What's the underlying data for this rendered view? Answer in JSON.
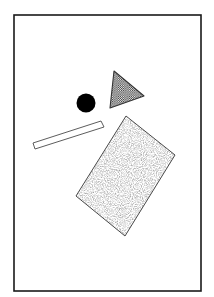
{
  "figure": {
    "canvas": {
      "width": 214,
      "height": 297,
      "background": "#ffffff"
    },
    "frame": {
      "name": "outer-frame",
      "x": 14,
      "y": 15,
      "width": 187,
      "height": 276,
      "stroke": "#1a1a1a",
      "stroke_width": 1.6,
      "fill": "none"
    },
    "shapes": [
      {
        "id": "circle",
        "label": "Solid black circle",
        "type": "circle",
        "cx": 86,
        "cy": 103,
        "r": 9.5,
        "fill": "#000000",
        "stroke": "none",
        "pattern": "solid"
      },
      {
        "id": "triangle",
        "label": "Checkerboard triangle pointing right",
        "type": "triangle",
        "points": "114,71 144,96 110,108",
        "fill_pattern": "checkerboard",
        "pattern_color": "#2b2b2b",
        "stroke": "#333333",
        "stroke_width": 1.1
      },
      {
        "id": "bar",
        "label": "Thin outlined slanted bar",
        "type": "quadrilateral",
        "points": "33,143 101,121 104,127 35,149",
        "fill": "#ffffff",
        "stroke": "#4a4a4a",
        "stroke_width": 0.9,
        "pattern": "none"
      },
      {
        "id": "rectangle",
        "label": "Large rotated rectangle with stipple texture",
        "type": "quadrilateral",
        "points": "126,116 175,155 125,236 76,196",
        "fill_pattern": "stipple",
        "pattern_color": "#555555",
        "stroke": "#4a4a4a",
        "stroke_width": 1.0
      }
    ],
    "colors": {
      "ink": "#1a1a1a",
      "paper": "#ffffff",
      "stipple": "#555555",
      "checker": "#2b2b2b"
    }
  }
}
